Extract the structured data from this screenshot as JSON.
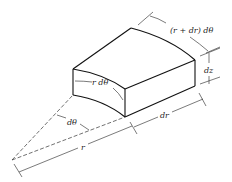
{
  "diagram": {
    "colors": {
      "stroke": "#111111",
      "background": "#ffffff",
      "text": "#222222"
    },
    "labels": {
      "outer_arc": "(r + dr) dθ",
      "height": "dz",
      "inner_arc": "r dθ",
      "angle": "dθ",
      "radial_thickness": "dr",
      "radius": "r"
    }
  }
}
